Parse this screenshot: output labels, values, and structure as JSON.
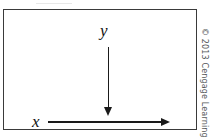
{
  "figure": {
    "title": "",
    "background_color": "#ffffff",
    "border_color": "#3a3a3a",
    "arrow_color": "#1a1a1a",
    "labels": {
      "y_axis": "y",
      "x_axis": "x"
    },
    "arrows": [
      {
        "name": "y-arrow",
        "label": "y",
        "direction": "down",
        "from": [
          104,
          37
        ],
        "to": [
          104,
          106
        ]
      },
      {
        "name": "x-arrow",
        "label": "x",
        "direction": "right",
        "from": [
          44,
          112
        ],
        "to": [
          166,
          112
        ]
      }
    ]
  },
  "credit": {
    "text": "© 2013 Cengage Learning",
    "color": "#55585a",
    "orientation": "vertical"
  }
}
